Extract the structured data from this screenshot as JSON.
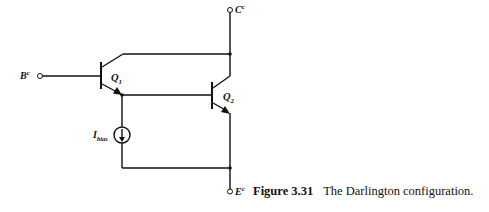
{
  "figure": {
    "number": "Figure 3.31",
    "title": "The Darlington configuration."
  },
  "terminals": {
    "collector": {
      "label": "C",
      "superscript": "c"
    },
    "base": {
      "label": "B",
      "superscript": "c"
    },
    "emitter": {
      "label": "E",
      "superscript": "c"
    }
  },
  "components": {
    "q1": {
      "label": "Q",
      "subscript": "1",
      "type": "npn-bjt"
    },
    "q2": {
      "label": "Q",
      "subscript": "2",
      "type": "npn-bjt"
    },
    "current_source": {
      "label": "I",
      "subscript": "bias",
      "type": "dc-current-source"
    }
  }
}
